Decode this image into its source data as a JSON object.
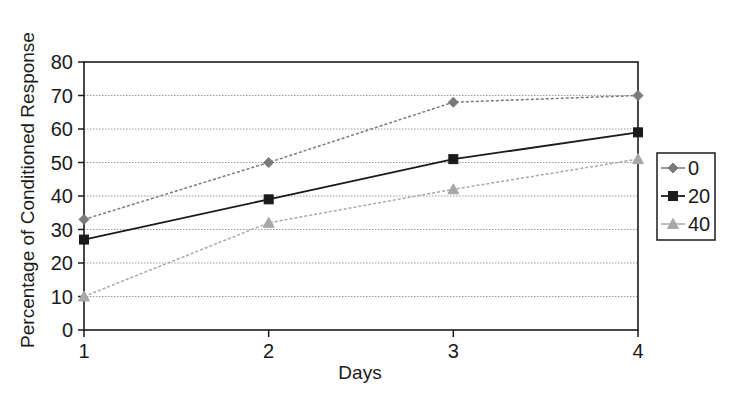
{
  "chart_data": {
    "type": "line",
    "title": "",
    "xlabel": "Days",
    "ylabel": "Percentage of Conditioned Response",
    "x": [
      1,
      2,
      3,
      4
    ],
    "x_tick_labels": [
      "1",
      "2",
      "3",
      "4"
    ],
    "ylim": [
      0,
      80
    ],
    "y_ticks": [
      0,
      10,
      20,
      30,
      40,
      50,
      60,
      70,
      80
    ],
    "y_tick_labels": [
      "0",
      "10",
      "20",
      "30",
      "40",
      "50",
      "60",
      "70",
      "80"
    ],
    "grid": "horizontal dotted",
    "legend_position": "right",
    "series": [
      {
        "name": "0",
        "values": [
          33,
          50,
          68,
          70
        ],
        "marker": "diamond",
        "line": "dashed",
        "color": "#7a7a7a"
      },
      {
        "name": "20",
        "values": [
          27,
          39,
          51,
          59
        ],
        "marker": "square",
        "line": "solid",
        "color": "#1a1a1a"
      },
      {
        "name": "40",
        "values": [
          10,
          32,
          42,
          51
        ],
        "marker": "triangle",
        "line": "dashed",
        "color": "#a8a8a8"
      }
    ]
  },
  "layout": {
    "plot": {
      "left": 84,
      "right": 638,
      "top": 62,
      "bottom": 330
    },
    "legend": {
      "left": 657,
      "top": 153,
      "width": 58,
      "height": 87
    }
  }
}
